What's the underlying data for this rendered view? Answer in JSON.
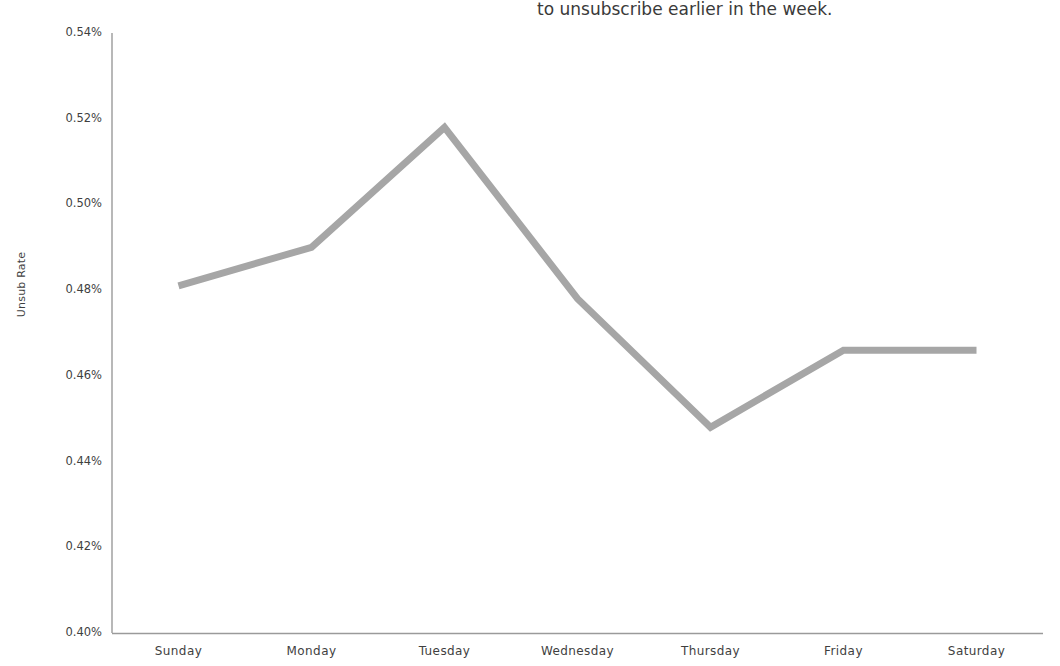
{
  "caption": {
    "fragment_text": "to unsubscribe earlier in the week."
  },
  "chart_data": {
    "type": "line",
    "title": "",
    "subtitle": "",
    "xlabel": "",
    "ylabel": "Unsub Rate",
    "categories": [
      "Sunday",
      "Monday",
      "Tuesday",
      "Wednesday",
      "Thursday",
      "Friday",
      "Saturday"
    ],
    "values": [
      0.481,
      0.49,
      0.518,
      0.478,
      0.448,
      0.466,
      0.466
    ],
    "value_format": "percent",
    "series": [
      {
        "name": "Unsub Rate",
        "values": [
          0.481,
          0.49,
          0.518,
          0.478,
          0.448,
          0.466,
          0.466
        ],
        "color": "#A6A6A6",
        "line_width": 7,
        "markers": false
      }
    ],
    "ylim": [
      0.4,
      0.54
    ],
    "ytick_values": [
      0.54,
      0.52,
      0.5,
      0.48,
      0.46,
      0.44,
      0.42,
      0.4
    ],
    "ytick_labels": [
      "0.54%",
      "0.52%",
      "0.50%",
      "0.48%",
      "0.46%",
      "0.44%",
      "0.42%",
      "0.40%"
    ],
    "xtick_labels": [
      "Sunday",
      "Monday",
      "Tuesday",
      "Wednesday",
      "Thursday",
      "Friday",
      "Saturday"
    ],
    "grid": false,
    "legend": false,
    "legend_position": "none",
    "axis_color": "#9a9a9a",
    "background_color": "#FFFFFF",
    "text_color": "#3F3F3F"
  },
  "layout": {
    "plot_left": 112,
    "plot_right": 1043,
    "plot_top": 33,
    "plot_bottom": 633
  }
}
